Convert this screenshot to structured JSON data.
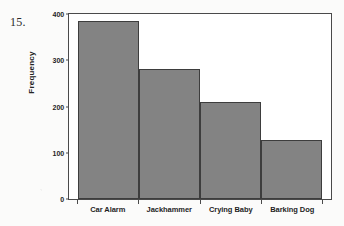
{
  "figure": {
    "item_number": "15.",
    "background_color": "#fbfbfa",
    "frame_color": "#4a4a4a",
    "bar_fill_color": "#838383",
    "bar_edge_color": "#3d3d3d"
  },
  "chart_data": {
    "type": "bar",
    "title": "",
    "xlabel": "",
    "ylabel": "Frequency",
    "categories": [
      "Car Alarm",
      "Jackhammer",
      "Crying Baby",
      "Barking Dog"
    ],
    "values": [
      385,
      281,
      210,
      128
    ],
    "ylim": [
      0,
      400
    ],
    "yticks": [
      0,
      100,
      200,
      300,
      400
    ],
    "ytick_labels": [
      "0",
      "100",
      "200",
      "300",
      "400"
    ],
    "grid": false,
    "legend": null,
    "orientation": "vertical",
    "bars_touching": true
  }
}
